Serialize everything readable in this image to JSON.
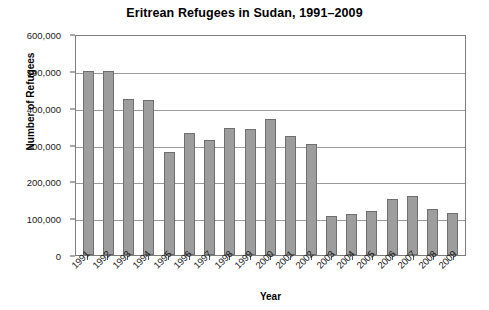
{
  "chart_data": {
    "type": "bar",
    "title": "Eritrean Refugees in Sudan, 1991–2009",
    "xlabel": "Year",
    "ylabel": "Number of Refugees",
    "ylim": [
      0,
      600000
    ],
    "ytick_step": 100000,
    "ytick_labels": [
      "600,000",
      "500,000",
      "400,000",
      "300,000",
      "200,000",
      "100,000",
      "0"
    ],
    "ytick_values": [
      600000,
      500000,
      400000,
      300000,
      200000,
      100000,
      0
    ],
    "grid": true,
    "legend": "none",
    "bar_color": "#9d9d9d",
    "bar_border_color": "#6f6f6f",
    "frame_color": "#7d7d7d",
    "categories": [
      "1991",
      "1992",
      "1993",
      "1994",
      "1995",
      "1996",
      "1997",
      "1998",
      "1999",
      "2000",
      "2001",
      "2002",
      "2003",
      "2004",
      "2005",
      "2006",
      "2007",
      "2008",
      "2009"
    ],
    "values": [
      500000,
      500000,
      424000,
      420000,
      280000,
      331000,
      312000,
      346000,
      341000,
      370000,
      323000,
      301000,
      106000,
      112000,
      120000,
      152000,
      160000,
      125000,
      113000
    ]
  }
}
